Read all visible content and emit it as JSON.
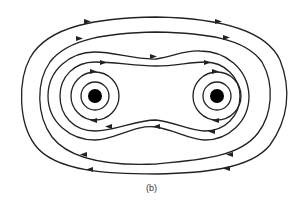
{
  "figure": {
    "caption": "(b)",
    "line_color": "#222222",
    "conductor_color": "#000000"
  },
  "conductors": [
    {
      "name": "left-wire",
      "cx": 95,
      "cy": 96,
      "r": 7
    },
    {
      "name": "right-wire",
      "cx": 217,
      "cy": 96,
      "r": 7
    }
  ]
}
